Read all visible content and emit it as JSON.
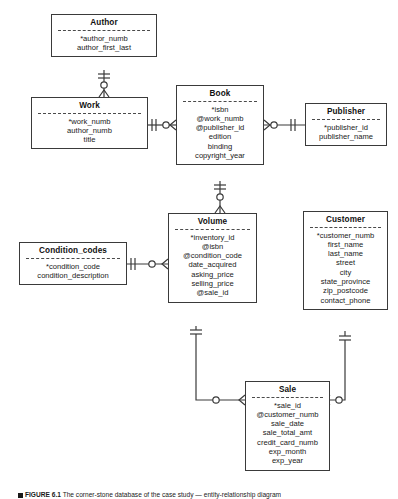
{
  "figure": {
    "caption_label": "FIGURE 6.1",
    "caption_text": "The corner-stone database of the case study — entity-relationship diagram"
  },
  "entities": [
    {
      "id": "author",
      "name": "Author",
      "attributes": [
        "*author_numb",
        "author_first_last"
      ]
    },
    {
      "id": "work",
      "name": "Work",
      "attributes": [
        "*work_numb",
        "author_numb",
        "title"
      ]
    },
    {
      "id": "book",
      "name": "Book",
      "attributes": [
        "*isbn",
        "@work_numb",
        "@publisher_id",
        "edition",
        "binding",
        "copyright_year"
      ]
    },
    {
      "id": "publisher",
      "name": "Publisher",
      "attributes": [
        "*publisher_id",
        "publisher_name"
      ]
    },
    {
      "id": "condition_codes",
      "name": "Condition_codes",
      "attributes": [
        "*condition_code",
        "condition_description"
      ]
    },
    {
      "id": "volume",
      "name": "Volume",
      "attributes": [
        "*inventory_id",
        "@isbn",
        "@condition_code",
        "date_acquired",
        "asking_price",
        "selling_price",
        "@sale_id"
      ]
    },
    {
      "id": "customer",
      "name": "Customer",
      "attributes": [
        "*customer_numb",
        "first_name",
        "last_name",
        "street",
        "city",
        "state_province",
        "zip_postcode",
        "contact_phone"
      ]
    },
    {
      "id": "sale",
      "name": "Sale",
      "attributes": [
        "*sale_id",
        "@customer_numb",
        "sale_date",
        "sale_total_amt",
        "credit_card_numb",
        "exp_month",
        "exp_year"
      ]
    }
  ],
  "relationships": [
    {
      "id": "author-work",
      "from": "author",
      "to": "work",
      "from_cardinality": "one-mandatory",
      "to_cardinality": "zero-or-many"
    },
    {
      "id": "work-book",
      "from": "work",
      "to": "book",
      "from_cardinality": "one-mandatory",
      "to_cardinality": "zero-or-many"
    },
    {
      "id": "book-publisher",
      "from": "book",
      "to": "publisher",
      "from_cardinality": "zero-or-many",
      "to_cardinality": "one-mandatory"
    },
    {
      "id": "book-volume",
      "from": "book",
      "to": "volume",
      "from_cardinality": "one-mandatory",
      "to_cardinality": "zero-or-many"
    },
    {
      "id": "condition-volume",
      "from": "condition_codes",
      "to": "volume",
      "from_cardinality": "one-mandatory",
      "to_cardinality": "zero-or-many"
    },
    {
      "id": "volume-sale",
      "from": "volume",
      "to": "sale",
      "from_cardinality": "one-mandatory",
      "to_cardinality": "zero-or-many"
    },
    {
      "id": "customer-sale",
      "from": "customer",
      "to": "sale",
      "from_cardinality": "one-mandatory",
      "to_cardinality": "zero-or-many"
    }
  ],
  "colors": {
    "border": "#3a3a3a",
    "text": "#1a1a1a",
    "background": "#ffffff"
  }
}
